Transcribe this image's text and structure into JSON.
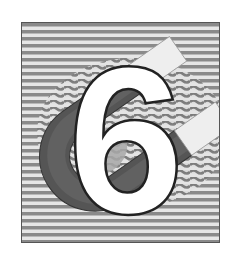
{
  "graphic": {
    "numeral": "6",
    "subject": "horseshoe magnet with magnetic field lines",
    "colors": {
      "background": "#ffffff",
      "stripe_dark": "#8a8a8a",
      "stripe_light": "#e6e6e6",
      "magnet_body": "#555555",
      "magnet_inner": "#a8a8a8",
      "pole": "#eeeeee",
      "numeral_fill": "#ffffff",
      "numeral_stroke": "#222222"
    }
  }
}
